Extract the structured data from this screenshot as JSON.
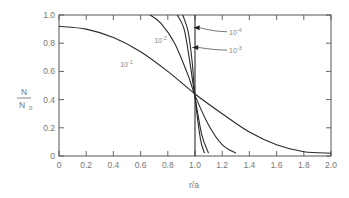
{
  "chart_data": {
    "type": "line",
    "title": "",
    "xlabel": "r/a",
    "ylabel_num": "N",
    "ylabel_den": "N",
    "ylabel_den_sub": "0",
    "xlim": [
      0,
      2.0
    ],
    "ylim": [
      0,
      1.0
    ],
    "x_ticks": [
      "0",
      "0.2",
      "0.4",
      "0.6",
      "0.8",
      "1.0",
      "1.2",
      "1.4",
      "1.6",
      "1.8",
      "2.0"
    ],
    "y_ticks": [
      "0",
      "0.2",
      "0.4",
      "0.6",
      "0.8",
      "1.0"
    ],
    "grid": false,
    "series": [
      {
        "name": "10^-1",
        "label_base": "10",
        "label_exp": "-1",
        "x": [
          0,
          0.2,
          0.4,
          0.6,
          0.8,
          1.0,
          1.2,
          1.4,
          1.6,
          1.8,
          2.0
        ],
        "y": [
          0.92,
          0.9,
          0.84,
          0.74,
          0.6,
          0.44,
          0.3,
          0.17,
          0.08,
          0.03,
          0.02
        ]
      },
      {
        "name": "10^-2",
        "label_base": "10",
        "label_exp": "-2",
        "x": [
          0.67,
          0.75,
          0.85,
          0.95,
          1.0,
          1.1,
          1.2,
          1.3
        ],
        "y": [
          1.0,
          0.94,
          0.8,
          0.57,
          0.43,
          0.22,
          0.08,
          0.02
        ]
      },
      {
        "name": "10^-3",
        "label_base": "10",
        "label_exp": "-3",
        "x": [
          0.87,
          0.92,
          0.96,
          1.0,
          1.05,
          1.1
        ],
        "y": [
          1.0,
          0.9,
          0.68,
          0.42,
          0.15,
          0.02
        ]
      },
      {
        "name": "10^-4",
        "label_base": "10",
        "label_exp": "-4",
        "x": [
          0.91,
          0.95,
          0.98,
          1.0,
          1.04,
          1.07
        ],
        "y": [
          1.0,
          0.88,
          0.66,
          0.42,
          0.12,
          0.02
        ]
      },
      {
        "name": "step",
        "x": [
          1.0,
          1.0
        ],
        "y": [
          1.0,
          0.0
        ]
      }
    ],
    "annotations": [
      {
        "text": "10^-1",
        "x": 0.45,
        "y": 0.63
      },
      {
        "text": "10^-2",
        "x": 0.7,
        "y": 0.8
      },
      {
        "text": "10^-4",
        "x": 1.25,
        "y": 0.86,
        "arrow_to": [
          0.99,
          0.91
        ]
      },
      {
        "text": "10^-3",
        "x": 1.25,
        "y": 0.73,
        "arrow_to": [
          0.98,
          0.77
        ]
      }
    ]
  }
}
